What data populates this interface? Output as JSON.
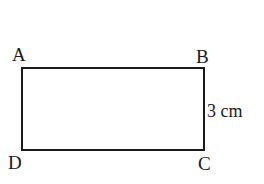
{
  "diagram": {
    "shape": "rectangle",
    "vertices": {
      "top_left": "A",
      "top_right": "B",
      "bottom_right": "C",
      "bottom_left": "D"
    },
    "side_labels": {
      "BC": "3 cm"
    },
    "stroke_color": "#1a1a1a",
    "background_color": "#ffffff"
  }
}
